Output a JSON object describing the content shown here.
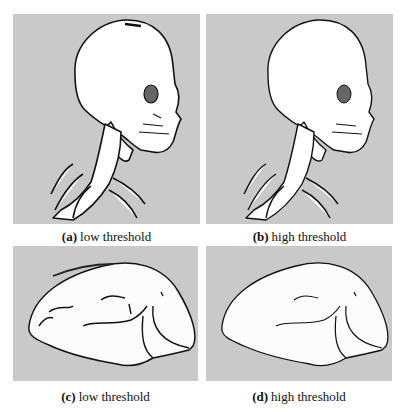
{
  "figure": {
    "panels": [
      {
        "id": "a",
        "tag": "(a)",
        "label": "low threshold",
        "subject": "skull-and-spine rendering",
        "background": "#c9c9c9"
      },
      {
        "id": "b",
        "tag": "(b)",
        "label": "high threshold",
        "subject": "skull-and-spine rendering",
        "background": "#c9c9c9"
      },
      {
        "id": "c",
        "tag": "(c)",
        "label": "low threshold",
        "subject": "organ surface rendering",
        "background": "#c9c9c9"
      },
      {
        "id": "d",
        "tag": "(d)",
        "label": "high threshold",
        "subject": "organ surface rendering",
        "background": "#c9c9c9"
      }
    ]
  }
}
